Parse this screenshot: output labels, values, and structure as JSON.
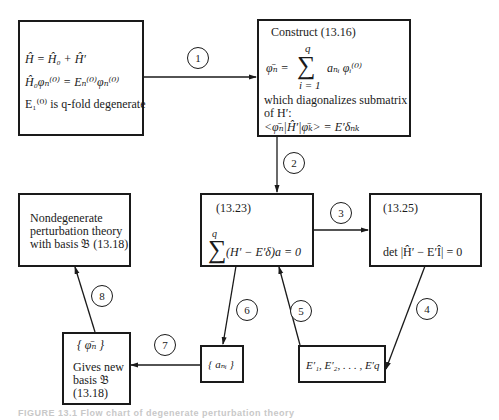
{
  "diagram": {
    "type": "flow-chart",
    "title_caption": "FIGURE 13.1  Flow chart of degenerate perturbation theory",
    "nodes": {
      "start": {
        "line1": "Ĥ = Ĥ₀ + Ĥ′",
        "line2": "Ĥ₀φₙ⁽⁰⁾ = Eₙ⁽⁰⁾φₙ⁽⁰⁾",
        "line3": "E₁⁽⁰⁾ is q-fold degenerate"
      },
      "construct": {
        "title": "Construct (13.16)",
        "sum_upper": "q",
        "sum_lhs": "φ̄ₙ =",
        "sum_symbol": "∑",
        "sum_rhs": "aₙᵢ φᵢ⁽⁰⁾",
        "sum_lower": "i = 1",
        "desc1": "which diagonalizes submatrix",
        "desc2": "of H′:",
        "matrix_eq": "<φ̄ₙ|Ĥ′|φ̄ₖ> = E′δₙₖ"
      },
      "eq1323": {
        "ref": "(13.23)",
        "sum_upper": "q",
        "sum_symbol": "∑",
        "equation": "(H′ − E′δ)a = 0"
      },
      "eq1325": {
        "ref": "(13.25)",
        "equation": "det |Ĥ′ − E′Î| = 0"
      },
      "nondegenerate": {
        "line1": "Nondegenerate",
        "line2": "perturbation theory",
        "line3": "with basis 𝔅 (13.18)"
      },
      "new_basis": {
        "set": "{ φ̄ₙ }",
        "line1": "Gives new",
        "line2": "basis 𝔅",
        "line3": "(13.18)"
      },
      "coefficients": {
        "set": "{ aₙᵢ }"
      },
      "eigenvalues": {
        "list": "E′₁, E′₂, . . . , E′q"
      }
    },
    "edges": [
      {
        "label": "1",
        "from": "start",
        "to": "construct"
      },
      {
        "label": "2",
        "from": "construct",
        "to": "eq1323"
      },
      {
        "label": "3",
        "from": "eq1323",
        "to": "eq1325"
      },
      {
        "label": "4",
        "from": "eq1325",
        "to": "eigenvalues"
      },
      {
        "label": "5",
        "from": "eigenvalues",
        "to": "eq1323"
      },
      {
        "label": "6",
        "from": "eq1323",
        "to": "coefficients"
      },
      {
        "label": "7",
        "from": "coefficients",
        "to": "new_basis"
      },
      {
        "label": "8",
        "from": "new_basis",
        "to": "nondegenerate"
      }
    ]
  }
}
